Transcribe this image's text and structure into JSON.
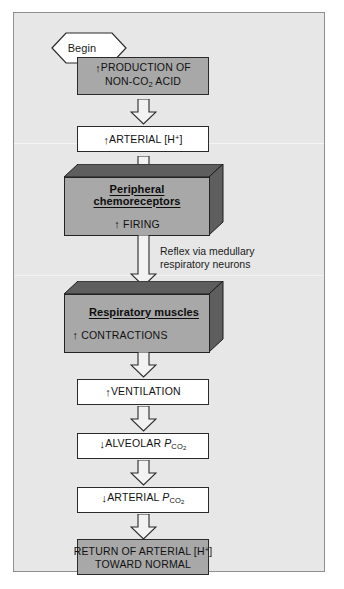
{
  "figure": {
    "background_color": "#e7e7e7",
    "frame_border_color": "#8f8f8f",
    "box_gray": "#a8a8a8",
    "box_white": "#ffffff",
    "block_shadow": "#5e5e5e",
    "outline_color": "#232323"
  },
  "begin": {
    "label": "Begin",
    "shape": "hexagon-diamond"
  },
  "nodes": [
    {
      "id": "production",
      "style": "gray-box",
      "lines": [
        "↑PRODUCTION OF",
        "NON-CO2 ACID"
      ],
      "line1_arrow": "up",
      "line1_text": "PRODUCTION OF",
      "line2_pre": "NON-CO",
      "line2_sub": "2",
      "line2_post": " ACID"
    },
    {
      "id": "arterial-h",
      "style": "white-box",
      "arrow": "up",
      "pre": "ARTERIAL [H",
      "sup": "+",
      "post": "]"
    },
    {
      "id": "peripheral-chemoreceptors",
      "style": "block-3d",
      "title": "Peripheral chemoreceptors",
      "title_align": "center",
      "body_arrow": "up",
      "body_text": "FIRING",
      "body_align": "center"
    },
    {
      "id": "respiratory-muscles",
      "style": "block-3d",
      "title": "Respiratory muscles",
      "title_align": "right",
      "body_arrow": "up",
      "body_text": "CONTRACTIONS",
      "body_align": "left"
    },
    {
      "id": "ventilation",
      "style": "white-box",
      "arrow": "up",
      "text": "VENTILATION"
    },
    {
      "id": "alveolar-pco2",
      "style": "white-box",
      "arrow": "down",
      "pre": "ALVEOLAR ",
      "ital": "P",
      "sub": "CO2"
    },
    {
      "id": "arterial-pco2",
      "style": "white-box",
      "arrow": "down",
      "pre": "ARTERIAL  ",
      "ital": "P",
      "sub": "CO2"
    },
    {
      "id": "return-normal",
      "style": "gray-box",
      "line1_pre": "RETURN OF ARTERIAL [H",
      "line1_sup": "+",
      "line1_post": "]",
      "line2": "TOWARD NORMAL"
    }
  ],
  "annotations": [
    {
      "id": "reflex-note",
      "text": "Reflex via medullary\nrespiratory neurons"
    }
  ],
  "glyphs": {
    "up_arrow": "↑",
    "down_arrow": "↓"
  }
}
